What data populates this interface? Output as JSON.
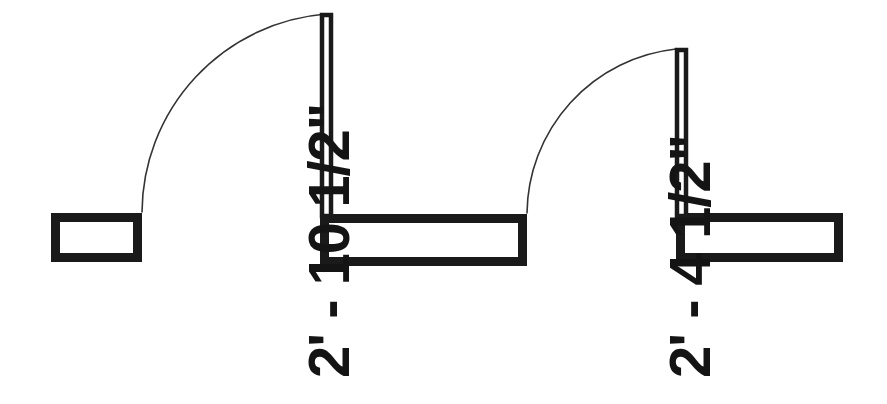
{
  "drawing": {
    "title": "Door Opening Plan Detail",
    "type": "architectural-floor-plan",
    "background_color": "#ffffff",
    "wall_color": "#1a1a1a",
    "wall_fill_color": "#ffffff",
    "swing_arc_color": "#333333",
    "door_leaf_color": "#1a1a1a",
    "text_color": "#141414",
    "canvas": {
      "width": 887,
      "height": 404
    }
  },
  "dimensions": [
    {
      "id": "opening-left",
      "label": "2' - 10 1/2\"",
      "feet": 2,
      "inches": 10.5,
      "rotation_deg": -90,
      "x": 300,
      "y": 378
    },
    {
      "id": "opening-right",
      "label": "2' - 4 1/2\"",
      "feet": 2,
      "inches": 4.5,
      "rotation_deg": -90,
      "x": 661,
      "y": 378
    }
  ],
  "walls": [
    {
      "id": "wall-left-stub",
      "x": 51,
      "y": 213,
      "width": 91,
      "height": 49
    },
    {
      "id": "wall-middle",
      "x": 320,
      "y": 214,
      "width": 207,
      "height": 52
    },
    {
      "id": "wall-right",
      "x": 676,
      "y": 213,
      "width": 167,
      "height": 49
    }
  ],
  "door_leaves": [
    {
      "id": "door-leaf-left",
      "x": 320,
      "y": 13,
      "width": 13,
      "height": 203
    },
    {
      "id": "door-leaf-right",
      "x": 675,
      "y": 48,
      "width": 13,
      "height": 168
    }
  ],
  "swing_arcs": [
    {
      "id": "swing-arc-left",
      "hinge_x": 333,
      "hinge_y": 214,
      "radius": 200,
      "start_x": 142,
      "start_y": 212,
      "end_x": 326,
      "end_y": 14
    },
    {
      "id": "swing-arc-right",
      "hinge_x": 681,
      "hinge_y": 214,
      "radius": 167,
      "start_x": 527,
      "start_y": 213,
      "end_x": 676,
      "end_y": 49
    }
  ]
}
